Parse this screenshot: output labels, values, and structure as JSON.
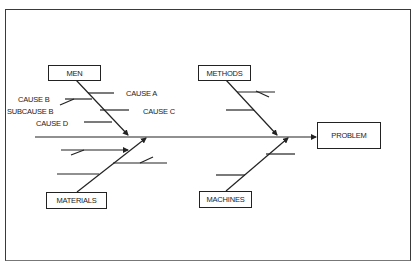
{
  "diagram": {
    "type": "fishbone",
    "effect": "PROBLEM",
    "categories": [
      {
        "id": "men",
        "label": "MEN"
      },
      {
        "id": "methods",
        "label": "METHODS"
      },
      {
        "id": "materials",
        "label": "MATERIALS"
      },
      {
        "id": "machines",
        "label": "MACHINES"
      }
    ],
    "cause_labels": {
      "cause_a": "CAUSE A",
      "cause_b": "CAUSE B",
      "subcause_b": "SUBCAUSE B",
      "cause_c": "CAUSE C",
      "cause_d": "CAUSE D"
    },
    "colors": {
      "line": "#222222",
      "frame": "#3a3a3a",
      "background": "#ffffff"
    }
  }
}
